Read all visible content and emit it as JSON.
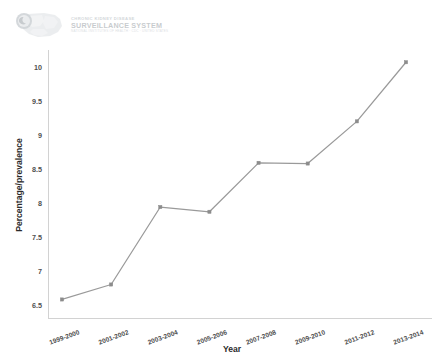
{
  "logo": {
    "name": "cdc-ckd-surveillance-logo",
    "line1": "CHRONIC KIDNEY DISEASE",
    "line2": "SURVEILLANCE SYSTEM",
    "line3": "NATIONAL INSTITUTES OF HEALTH · CDC · UNITED STATES"
  },
  "colors": {
    "line": "#9a9a9a",
    "marker": "#8c8c8c",
    "axis": "#d2d2d2",
    "tick_text": "#4f4f4f",
    "title_text": "#2b2b2b",
    "background": "#ffffff"
  },
  "chart_data": {
    "type": "line",
    "title": "",
    "subtitle": "",
    "xlabel": "Year",
    "ylabel": "Percentage/prevalence",
    "categories": [
      "1999-2000",
      "2001-2002",
      "2003-2004",
      "2005-2006",
      "2007-2008",
      "2009-2010",
      "2011-2012",
      "2013-2014"
    ],
    "values": [
      6.58,
      6.8,
      7.94,
      7.87,
      8.59,
      8.58,
      9.2,
      10.07
    ],
    "series": [
      {
        "name": "Percentage/prevalence",
        "values": [
          6.58,
          6.8,
          7.94,
          7.87,
          8.59,
          8.58,
          9.2,
          10.07
        ]
      }
    ],
    "ylim": [
      6.3,
      10.25
    ],
    "yticks": [
      6.5,
      7,
      7.5,
      8,
      8.5,
      9,
      9.5,
      10
    ],
    "ytick_labels": [
      "6.5",
      "7",
      "7.5",
      "8",
      "8.5",
      "9",
      "9.5",
      "10"
    ],
    "grid": false,
    "legend": false,
    "legend_position": "none",
    "markers": true,
    "annotations": []
  }
}
